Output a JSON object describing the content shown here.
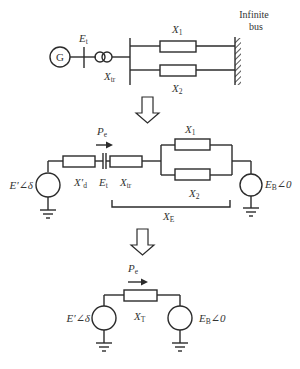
{
  "diagram": {
    "top": {
      "generator_label": "G",
      "terminal_voltage": {
        "main": "E",
        "sub": "t"
      },
      "transformer_reactance": {
        "main": "X",
        "sub": "tr"
      },
      "line1": {
        "main": "X",
        "sub": "1"
      },
      "line2": {
        "main": "X",
        "sub": "2"
      },
      "infinite_bus_line1": "Infinite",
      "infinite_bus_line2": "bus"
    },
    "middle": {
      "power_flow": {
        "main": "P",
        "sub": "e"
      },
      "source_left": "E′∠δ",
      "transient_reactance": {
        "main": "X′",
        "sub": "d"
      },
      "terminal_voltage": {
        "main": "E",
        "sub": "t"
      },
      "transformer_reactance": {
        "main": "X",
        "sub": "tr"
      },
      "line1": {
        "main": "X",
        "sub": "1"
      },
      "line2": {
        "main": "X",
        "sub": "2"
      },
      "equivalent_reactance": {
        "main": "X",
        "sub": "E"
      },
      "source_right": {
        "main": "E",
        "sub": "B",
        "angle": "∠0"
      }
    },
    "bottom": {
      "power_flow": {
        "main": "P",
        "sub": "e"
      },
      "source_left": "E′∠δ",
      "total_reactance": {
        "main": "X",
        "sub": "T"
      },
      "source_right": {
        "main": "E",
        "sub": "B",
        "angle": "∠0"
      }
    }
  }
}
